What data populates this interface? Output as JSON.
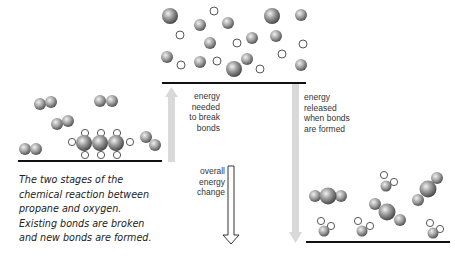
{
  "diagram": {
    "labels": {
      "break": "energy\nneeded\nto break\nbonds",
      "break_lines": [
        "energy",
        "needed",
        "to break",
        "bonds"
      ],
      "form_lines": [
        "energy",
        "released",
        "when bonds",
        "are formed"
      ],
      "overall_lines": [
        "overall",
        "energy",
        "change"
      ]
    },
    "caption_lines": [
      "The two stages of the",
      "chemical reaction between",
      "propane and oxygen.",
      "Existing bonds are broken",
      "and new bonds are formed."
    ],
    "levels": {
      "reactants": "propane + oxygen (left, middle level)",
      "atoms": "separated atoms (top level)",
      "products": "carbon dioxide + water (right, low level)"
    },
    "colors": {
      "baseline": "#111111",
      "arrow_fill": "#d9d9d9",
      "overall_arrow_stroke": "#333333",
      "atom_dark": "#555555",
      "atom_light": "#e0e0e0",
      "hydrogen_stroke": "#444444"
    }
  }
}
